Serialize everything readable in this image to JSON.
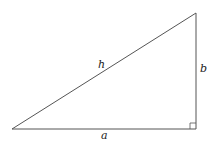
{
  "diagram": {
    "type": "right-triangle",
    "colors": {
      "stroke": "#555555",
      "label": "#222222",
      "background": "#ffffff"
    },
    "vertices": {
      "left": {
        "x": 12,
        "y": 129
      },
      "right_angle": {
        "x": 196,
        "y": 129
      },
      "top": {
        "x": 196,
        "y": 13
      }
    },
    "labels": {
      "hypotenuse": "h",
      "vertical_side": "b",
      "base": "a"
    },
    "right_angle_marker": {
      "size": 6
    }
  }
}
